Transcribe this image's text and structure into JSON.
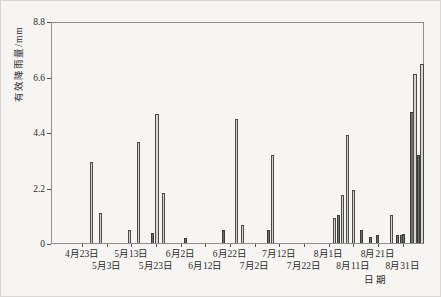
{
  "chart_data": {
    "type": "bar",
    "title": "",
    "ylabel": "有效降雨量/mm",
    "xlabel": "日期",
    "ylim": [
      0,
      8.8
    ],
    "yticks": [
      0,
      2.2,
      4.4,
      6.6,
      8.8
    ],
    "ytick_labels": [
      "0",
      "2.2",
      "4.4",
      "6.6",
      "8.8"
    ],
    "xtick_labels": [
      "4月23日",
      "5月3日",
      "5月13日",
      "5月23日",
      "6月2日",
      "6月12日",
      "6月22日",
      "7月2日",
      "7月12日",
      "7月22日",
      "8月1日",
      "8月11日",
      "8月21日",
      "8月31日"
    ],
    "x_tick_interval_days": 10,
    "grid": false,
    "legend": null,
    "bars": [
      {
        "x_px": 89.5,
        "mm": 3.2,
        "shade": "light"
      },
      {
        "x_px": 98,
        "mm": 1.2,
        "shade": "light"
      },
      {
        "x_px": 127,
        "mm": 0.5,
        "shade": "light"
      },
      {
        "x_px": 136,
        "mm": 4.0,
        "shade": "light"
      },
      {
        "x_px": 150,
        "mm": 0.4,
        "shade": "dark"
      },
      {
        "x_px": 154.5,
        "mm": 5.1,
        "shade": "light"
      },
      {
        "x_px": 161.5,
        "mm": 2.0,
        "shade": "light"
      },
      {
        "x_px": 183,
        "mm": 0.2,
        "shade": "dark"
      },
      {
        "x_px": 221.5,
        "mm": 0.5,
        "shade": "dark"
      },
      {
        "x_px": 234,
        "mm": 4.9,
        "shade": "light"
      },
      {
        "x_px": 240,
        "mm": 0.7,
        "shade": "light"
      },
      {
        "x_px": 266.5,
        "mm": 0.5,
        "shade": "dark"
      },
      {
        "x_px": 270.5,
        "mm": 3.5,
        "shade": "light"
      },
      {
        "x_px": 332,
        "mm": 1.0,
        "shade": "light"
      },
      {
        "x_px": 336.5,
        "mm": 1.1,
        "shade": "dark"
      },
      {
        "x_px": 340.5,
        "mm": 1.9,
        "shade": "light"
      },
      {
        "x_px": 345.5,
        "mm": 4.3,
        "shade": "light"
      },
      {
        "x_px": 351,
        "mm": 2.1,
        "shade": "light"
      },
      {
        "x_px": 359.5,
        "mm": 0.5,
        "shade": "dark"
      },
      {
        "x_px": 368,
        "mm": 0.25,
        "shade": "dark"
      },
      {
        "x_px": 375,
        "mm": 0.3,
        "shade": "dark"
      },
      {
        "x_px": 389.5,
        "mm": 1.1,
        "shade": "light"
      },
      {
        "x_px": 395,
        "mm": 0.3,
        "shade": "dark"
      },
      {
        "x_px": 399,
        "mm": 0.3,
        "shade": "dark"
      },
      {
        "x_px": 401.5,
        "mm": 0.35,
        "shade": "dark"
      },
      {
        "x_px": 409.5,
        "mm": 5.2,
        "shade": "dark"
      },
      {
        "x_px": 413,
        "mm": 6.7,
        "shade": "light"
      },
      {
        "x_px": 416,
        "mm": 3.5,
        "shade": "dark"
      },
      {
        "x_px": 419.5,
        "mm": 7.1,
        "shade": "light"
      }
    ]
  },
  "colors": {
    "bar_light_fill": "#d7d6d2",
    "bar_dark_fill": "#6d6d6a",
    "bar_outline": "#4a4a48",
    "axis": "#8d8d8a",
    "text": "#2b2b2b",
    "background": "#f6f5f2"
  }
}
